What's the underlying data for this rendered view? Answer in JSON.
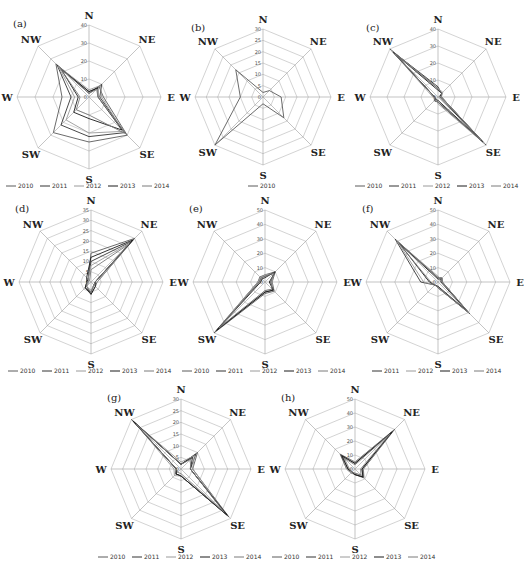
{
  "chart_data": [
    {
      "id": "a",
      "label": "(a)",
      "type": "radar",
      "center": [
        89,
        97
      ],
      "radius": 72,
      "axes": [
        "N",
        "NE",
        "E",
        "SE",
        "S",
        "SW",
        "W",
        "NW"
      ],
      "rmax": 40,
      "ticks": [
        0,
        10,
        20,
        30,
        40
      ],
      "legend": [
        "2010",
        "2011",
        "2012",
        "2013",
        "2014"
      ],
      "legend_y": 188,
      "series": [
        {
          "name": "2010",
          "values": [
            3,
            8,
            8,
            30,
            25,
            28,
            15,
            26
          ]
        },
        {
          "name": "2011",
          "values": [
            2,
            10,
            6,
            28,
            22,
            22,
            10,
            25
          ]
        },
        {
          "name": "2012",
          "values": [
            4,
            9,
            7,
            27,
            20,
            18,
            8,
            24
          ]
        },
        {
          "name": "2013",
          "values": [
            3,
            7,
            5,
            26,
            12,
            12,
            6,
            22
          ]
        },
        {
          "name": "2014",
          "values": [
            2,
            6,
            5,
            29,
            10,
            10,
            5,
            23
          ]
        }
      ]
    },
    {
      "id": "b",
      "label": "(b)",
      "type": "radar",
      "center": [
        263,
        97
      ],
      "radius": 68,
      "axes": [
        "N",
        "NE",
        "E",
        "SE",
        "S",
        "SW",
        "W",
        "NW"
      ],
      "rmax": 30,
      "ticks": [
        0,
        5,
        10,
        15,
        20,
        25,
        30
      ],
      "legend": [
        "2010"
      ],
      "legend_y": 188,
      "series": [
        {
          "name": "2010",
          "values": [
            2,
            4,
            8,
            13,
            3,
            30,
            10,
            17
          ]
        }
      ]
    },
    {
      "id": "c",
      "label": "(c)",
      "type": "radar",
      "center": [
        438,
        97
      ],
      "radius": 68,
      "axes": [
        "N",
        "NE",
        "E",
        "SE",
        "S",
        "SW",
        "W",
        "NW"
      ],
      "rmax": 40,
      "ticks": [
        0,
        10,
        20,
        30,
        40
      ],
      "legend": [
        "2010",
        "2011",
        "2012",
        "2013",
        "2014"
      ],
      "legend_y": 188,
      "series": [
        {
          "name": "2010",
          "values": [
            5,
            3,
            2,
            40,
            3,
            3,
            2,
            40
          ]
        },
        {
          "name": "2011",
          "values": [
            6,
            3,
            2,
            38,
            3,
            3,
            2,
            38
          ]
        },
        {
          "name": "2012",
          "values": [
            5,
            4,
            2,
            39,
            4,
            2,
            3,
            39
          ]
        },
        {
          "name": "2013",
          "values": [
            4,
            3,
            1,
            37,
            2,
            2,
            2,
            37
          ]
        },
        {
          "name": "2014",
          "values": [
            5,
            3,
            2,
            36,
            3,
            3,
            2,
            36
          ]
        }
      ]
    },
    {
      "id": "d",
      "label": "(d)",
      "type": "radar",
      "center": [
        91,
        282
      ],
      "radius": 72,
      "axes": [
        "N",
        "NE",
        "E",
        "SE",
        "S",
        "SW",
        "W",
        "NW"
      ],
      "rmax": 35,
      "ticks": [
        0,
        5,
        10,
        15,
        20,
        25,
        30,
        35
      ],
      "legend": [
        "2010",
        "2011",
        "2012",
        "2013",
        "2014"
      ],
      "legend_y": 373,
      "series": [
        {
          "name": "2010",
          "values": [
            14,
            30,
            3,
            3,
            6,
            3,
            2,
            2
          ]
        },
        {
          "name": "2011",
          "values": [
            10,
            28,
            2,
            2,
            5,
            4,
            2,
            2
          ]
        },
        {
          "name": "2012",
          "values": [
            8,
            27,
            3,
            2,
            4,
            3,
            1,
            2
          ]
        },
        {
          "name": "2013",
          "values": [
            12,
            29,
            2,
            3,
            6,
            4,
            2,
            3
          ]
        },
        {
          "name": "2014",
          "values": [
            6,
            26,
            2,
            2,
            5,
            3,
            2,
            1
          ]
        }
      ]
    },
    {
      "id": "e",
      "label": "(e)",
      "type": "radar",
      "center": [
        265,
        282
      ],
      "radius": 72,
      "axes": [
        "N",
        "NE",
        "E",
        "SE",
        "S",
        "SW",
        "W",
        "NW"
      ],
      "rmax": 50,
      "ticks": [
        0,
        10,
        20,
        30,
        40,
        50
      ],
      "legend": [
        "2010",
        "2011",
        "2012",
        "2013",
        "2014"
      ],
      "legend_y": 373,
      "series": [
        {
          "name": "2010",
          "values": [
            5,
            10,
            5,
            9,
            8,
            50,
            5,
            5
          ]
        },
        {
          "name": "2011",
          "values": [
            4,
            9,
            4,
            8,
            7,
            48,
            4,
            4
          ]
        },
        {
          "name": "2012",
          "values": [
            5,
            8,
            5,
            7,
            6,
            46,
            5,
            4
          ]
        },
        {
          "name": "2013",
          "values": [
            3,
            10,
            3,
            8,
            7,
            47,
            3,
            3
          ]
        },
        {
          "name": "2014",
          "values": [
            4,
            9,
            4,
            7,
            6,
            45,
            4,
            4
          ]
        }
      ]
    },
    {
      "id": "f",
      "label": "(f)",
      "type": "radar",
      "center": [
        438,
        282
      ],
      "radius": 72,
      "axes": [
        "N",
        "NE",
        "E",
        "SE",
        "S",
        "SW",
        "W",
        "NW"
      ],
      "rmax": 50,
      "ticks": [
        0,
        10,
        20,
        30,
        40,
        50
      ],
      "legend": [
        "2011",
        "2012",
        "2013",
        "2014"
      ],
      "legend_y": 373,
      "series": [
        {
          "name": "2011",
          "values": [
            3,
            4,
            3,
            31,
            4,
            3,
            12,
            42
          ]
        },
        {
          "name": "2012",
          "values": [
            4,
            3,
            3,
            30,
            4,
            3,
            10,
            40
          ]
        },
        {
          "name": "2013",
          "values": [
            2,
            3,
            2,
            29,
            3,
            3,
            6,
            38
          ]
        },
        {
          "name": "2014",
          "values": [
            3,
            3,
            3,
            30,
            4,
            3,
            5,
            41
          ]
        }
      ]
    },
    {
      "id": "g",
      "label": "(g)",
      "type": "radar",
      "center": [
        181,
        469
      ],
      "radius": 70,
      "axes": [
        "N",
        "NE",
        "E",
        "SE",
        "S",
        "SW",
        "W",
        "NW"
      ],
      "rmax": 30,
      "ticks": [
        0,
        5,
        10,
        15,
        20,
        25,
        30
      ],
      "legend": [
        "2010",
        "2011",
        "2012",
        "2013",
        "2014"
      ],
      "legend_y": 559,
      "series": [
        {
          "name": "2010",
          "values": [
            2,
            10,
            5,
            29,
            3,
            3,
            2,
            30
          ]
        },
        {
          "name": "2011",
          "values": [
            2,
            9,
            4,
            28,
            3,
            3,
            2,
            29
          ]
        },
        {
          "name": "2012",
          "values": [
            3,
            8,
            5,
            27,
            3,
            4,
            3,
            28
          ]
        },
        {
          "name": "2013",
          "values": [
            2,
            7,
            4,
            28,
            3,
            3,
            2,
            29
          ]
        },
        {
          "name": "2014",
          "values": [
            2,
            6,
            4,
            26,
            2,
            2,
            2,
            27
          ]
        }
      ]
    },
    {
      "id": "h",
      "label": "(h)",
      "type": "radar",
      "center": [
        355,
        469
      ],
      "radius": 70,
      "axes": [
        "N",
        "NE",
        "E",
        "SE",
        "S",
        "SW",
        "W",
        "NW"
      ],
      "rmax": 50,
      "ticks": [
        0,
        10,
        20,
        30,
        40,
        50
      ],
      "legend": [
        "2010",
        "2011",
        "2012",
        "2013",
        "2014"
      ],
      "legend_y": 559,
      "series": [
        {
          "name": "2010",
          "values": [
            5,
            40,
            6,
            9,
            4,
            4,
            6,
            15
          ]
        },
        {
          "name": "2011",
          "values": [
            4,
            38,
            5,
            8,
            4,
            3,
            5,
            14
          ]
        },
        {
          "name": "2012",
          "values": [
            5,
            36,
            6,
            7,
            3,
            4,
            6,
            12
          ]
        },
        {
          "name": "2013",
          "values": [
            4,
            37,
            5,
            8,
            4,
            3,
            5,
            13
          ]
        },
        {
          "name": "2014",
          "values": [
            3,
            35,
            4,
            6,
            3,
            3,
            4,
            11
          ]
        }
      ]
    }
  ],
  "series_colors": {
    "2010": "#5a5a5a",
    "2011": "#333333",
    "2012": "#9a9a9a",
    "2013": "#1a1a1a",
    "2014": "#7a7a7a"
  },
  "grid_color": "#b5b5b5",
  "axis_color": "#9c9c9c"
}
